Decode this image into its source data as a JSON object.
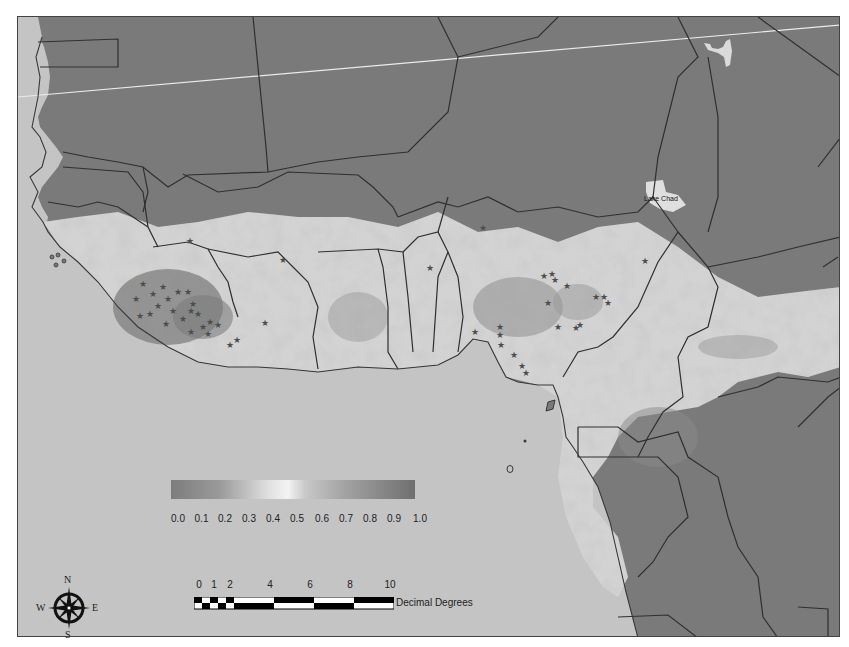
{
  "map": {
    "region": "West and Central Africa",
    "colors": {
      "ocean": "#c9c9c9",
      "land_dark": "#7a7a7a",
      "suitability_light": "#e6e6e6",
      "suitability_mid": "#a3a3a3",
      "border": "#2a2a2a",
      "graticule": "#f2f2f2",
      "star_marker": "#4a4a4a"
    },
    "labels": {
      "lake_chad": "Lake Chad"
    }
  },
  "legend": {
    "gradient_stops": [
      "#7d7d7d",
      "#9a9a9a",
      "#e0e0e0",
      "#f3f3f3",
      "#a5a5a5",
      "#6f6f6f"
    ],
    "ticks": [
      "0.0",
      "0.1",
      "0.2",
      "0.3",
      "0.4",
      "0.5",
      "0.6",
      "0.7",
      "0.8",
      "0.9",
      "1.0"
    ]
  },
  "scale_bar": {
    "labels": [
      "0",
      "1",
      "2",
      "4",
      "6",
      "8",
      "10"
    ],
    "unit": "Decimal Degrees"
  },
  "north_arrow": {
    "n": "N",
    "s": "S",
    "e": "E",
    "w": "W"
  }
}
